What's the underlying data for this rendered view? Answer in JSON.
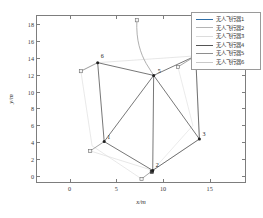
{
  "chart_data": {
    "type": "scatter",
    "title": "",
    "xlabel": "x/m",
    "ylabel": "y/m",
    "xlim": [
      -3.5,
      19.0
    ],
    "ylim": [
      -0.9,
      18.9
    ],
    "xticks": [
      0,
      5,
      10,
      15
    ],
    "yticks": [
      0,
      2,
      4,
      6,
      8,
      10,
      12,
      14,
      16,
      18
    ],
    "grid": false,
    "legend_position": "top-right",
    "series": [
      {
        "name": "无人飞行器1",
        "color": "#0072bd",
        "start": [
          2.2,
          3.0
        ],
        "end": [
          3.7,
          4.1
        ]
      },
      {
        "name": "无人飞行器2",
        "color": "#d95319",
        "start": [
          7.7,
          -0.3
        ],
        "end": [
          8.9,
          0.7
        ]
      },
      {
        "name": "无人飞行器3",
        "color": "#edb120",
        "start": [
          11.6,
          12.9
        ],
        "end": [
          13.5,
          14.2
        ]
      },
      {
        "name": "无人飞行器4",
        "color": "#7e2f8e",
        "start": [
          7.2,
          18.4
        ],
        "end": [
          9.0,
          11.9
        ]
      },
      {
        "name": "无人飞行器5",
        "color": "#77ac30",
        "start": [
          1.2,
          12.4
        ],
        "end": [
          3.0,
          13.4
        ]
      },
      {
        "name": "无人飞行器6",
        "color": "#4dbeee",
        "start": [
          9.0,
          11.9
        ],
        "end": [
          9.0,
          11.9
        ]
      }
    ],
    "nodes": [
      {
        "id": "1",
        "x": 3.7,
        "y": 4.1
      },
      {
        "id": "2",
        "x": 8.9,
        "y": 0.7
      },
      {
        "id": "3",
        "x": 13.9,
        "y": 4.4
      },
      {
        "id": "4",
        "x": 13.5,
        "y": 14.2
      },
      {
        "id": "5",
        "x": 9.0,
        "y": 11.9
      },
      {
        "id": "6",
        "x": 3.0,
        "y": 13.4
      }
    ],
    "edges": [
      [
        "1",
        "6"
      ],
      [
        "1",
        "2"
      ],
      [
        "1",
        "5"
      ],
      [
        "2",
        "3"
      ],
      [
        "2",
        "5"
      ],
      [
        "3",
        "4"
      ],
      [
        "3",
        "5"
      ],
      [
        "4",
        "5"
      ],
      [
        "5",
        "6"
      ]
    ],
    "start_markers": [
      {
        "x": 2.2,
        "y": 3.0
      },
      {
        "x": 7.7,
        "y": -0.3
      },
      {
        "x": 11.6,
        "y": 12.9
      },
      {
        "x": 7.2,
        "y": 18.4
      },
      {
        "x": 1.2,
        "y": 12.4
      }
    ]
  },
  "axis": {
    "x_title": "x/m",
    "y_title": "y/m",
    "x_tick_labels": [
      "0",
      "5",
      "10",
      "15"
    ],
    "y_tick_labels": [
      "0",
      "2",
      "4",
      "6",
      "8",
      "10",
      "12",
      "14",
      "16",
      "18"
    ]
  },
  "legend": {
    "items": [
      {
        "label": "无人飞行器1",
        "color": "#2f6fa8"
      },
      {
        "label": "无人飞行器2",
        "color": "#b4b4b4"
      },
      {
        "label": "无人飞行器3",
        "color": "#dcdcdc"
      },
      {
        "label": "无人飞行器4",
        "color": "#555555"
      },
      {
        "label": "无人飞行器5",
        "color": "#8e8e8e"
      },
      {
        "label": "无人飞行器6",
        "color": "#c9c9c9"
      }
    ]
  },
  "node_labels": [
    "1",
    "2",
    "3",
    "4",
    "5",
    "6"
  ]
}
